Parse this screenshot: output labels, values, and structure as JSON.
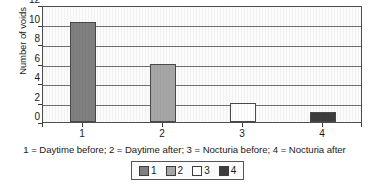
{
  "chart_data": {
    "type": "bar",
    "title": "",
    "subtitle": "",
    "xlabel": "",
    "ylabel": "Number of voids",
    "categories": [
      "1",
      "2",
      "3",
      "4"
    ],
    "values": [
      10.3,
      6,
      2,
      1
    ],
    "series": [
      {
        "name": "Number of voids",
        "values": [
          10.3,
          6,
          2,
          1
        ]
      }
    ],
    "ylim": [
      0,
      12
    ],
    "yticks": [
      0,
      2,
      4,
      6,
      8,
      10,
      12
    ],
    "ytick_labels": [
      "0",
      "2",
      "4",
      "6",
      "8",
      "10",
      "12"
    ],
    "xtick_labels": [
      "1",
      "2",
      "3",
      "4"
    ],
    "grid": "horizontal",
    "legend_position": "bottom",
    "legend": [
      {
        "label": "1",
        "color": "#808080"
      },
      {
        "label": "2",
        "color": "#a6a6a6"
      },
      {
        "label": "3",
        "color": "#ffffff"
      },
      {
        "label": "4",
        "color": "#3d3d3d"
      }
    ],
    "bar_colors": [
      "#808080",
      "#a6a6a6",
      "#ffffff",
      "#3d3d3d"
    ],
    "annotations": [
      "1 = Daytime before; 2 = Daytime after; 3 = Nocturia before; 4 = Nocturia after"
    ]
  },
  "caption": "1 = Daytime before; 2 = Daytime after; 3 = Nocturia before; 4 = Nocturia after",
  "colors": {
    "axis": "#4d4d4d",
    "gridline": "#6f6f6f",
    "plot_background": "#fbfbfb",
    "page_background": "#ffffff",
    "text": "#1a1a1a"
  }
}
